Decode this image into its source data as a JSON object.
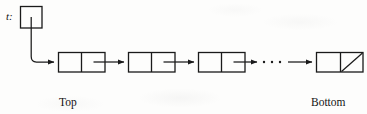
{
  "diagram": {
    "type": "linked-list-stack",
    "pointer_variable": {
      "label": "t:",
      "name": "t",
      "box": {
        "x": 20,
        "y": 6,
        "w": 22,
        "h": 22
      }
    },
    "nodes": [
      {
        "id": "node-1",
        "x": 58,
        "y": 52,
        "w": 47,
        "h": 20,
        "divider_at": 23,
        "null_pointer": false,
        "caption_line1": "Top",
        "caption_line2": "element"
      },
      {
        "id": "node-2",
        "x": 128,
        "y": 52,
        "w": 47,
        "h": 20,
        "divider_at": 23,
        "null_pointer": false,
        "caption_line1": "",
        "caption_line2": ""
      },
      {
        "id": "node-3",
        "x": 198,
        "y": 52,
        "w": 47,
        "h": 20,
        "divider_at": 23,
        "null_pointer": false,
        "caption_line1": "",
        "caption_line2": ""
      },
      {
        "id": "node-4",
        "x": 316,
        "y": 52,
        "w": 47,
        "h": 20,
        "divider_at": 24,
        "null_pointer": true,
        "caption_line1": "Bottom",
        "caption_line2": "element"
      }
    ],
    "captions": {
      "top_element_line1": "Top",
      "top_element_line2": "element",
      "bottom_element_line1": "Bottom",
      "bottom_element_line2": "element"
    },
    "ellipsis": {
      "text": "· · ·",
      "dot_count": 3,
      "x_start": 258,
      "x_end": 286,
      "y": 62
    },
    "colors": {
      "stroke": "#1a1a1a",
      "background": "#fdfdfc",
      "text": "#131313"
    },
    "stroke_width": 1.2
  }
}
